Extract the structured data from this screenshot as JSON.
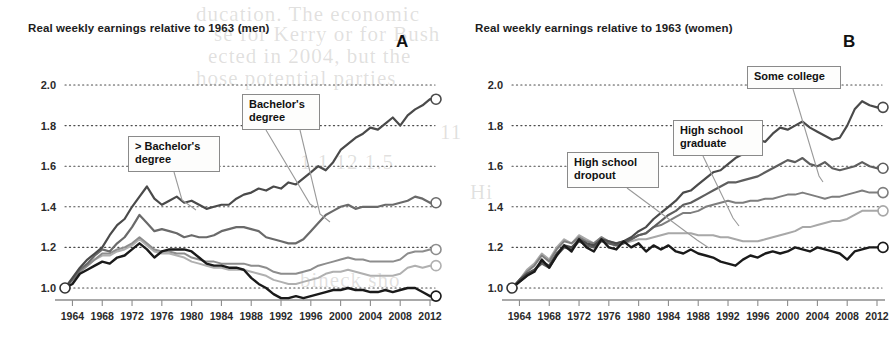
{
  "bleed_text": [
    {
      "text": "ducation. The economic",
      "x": 196,
      "y": 2
    },
    {
      "text": "se for Kerry or for Bush",
      "x": 214,
      "y": 22
    },
    {
      "text": "ected in 2004, but the",
      "x": 208,
      "y": 44
    },
    {
      "text": "hose potential parties",
      "x": 196,
      "y": 66
    },
    {
      "text": "11",
      "x": 440,
      "y": 120
    },
    {
      "text": "1.1  12  1.5",
      "x": 300,
      "y": 150
    },
    {
      "text": "Hi",
      "x": 470,
      "y": 180
    },
    {
      "text": "bineck  sho",
      "x": 300,
      "y": 268
    }
  ],
  "panels": [
    {
      "letter": "A",
      "letter_x": 396,
      "title": "Real weekly earnings relative to 1963 (men)",
      "callouts": [
        {
          "label": "> Bachelor's\ndegree",
          "x": 128,
          "y": 136,
          "w": 92,
          "h": 36,
          "leader": [
            [
              174,
              172
            ],
            [
              182,
              200
            ],
            [
              196,
              210
            ]
          ]
        },
        {
          "label": "Bachelor's\ndegree",
          "x": 242,
          "y": 94,
          "w": 78,
          "h": 36,
          "leader": [
            [
              300,
              130
            ],
            [
              320,
              214
            ],
            [
              330,
              222
            ]
          ]
        },
        {
          "label": "",
          "x": 0,
          "y": 0,
          "w": 0,
          "h": 0,
          "leader": [
            [
              266,
              130
            ],
            [
              310,
              204
            ],
            [
              316,
              208
            ]
          ]
        }
      ]
    },
    {
      "letter": "B",
      "letter_x": 396,
      "title": "Real weekly earnings relative to 1963 (women)",
      "callouts": [
        {
          "label": "High school\ndropout",
          "x": 120,
          "y": 152,
          "w": 92,
          "h": 36,
          "leader": [
            [
              180,
              188
            ],
            [
              250,
              240
            ],
            [
              262,
              248
            ]
          ]
        },
        {
          "label": "High school\ngraduate",
          "x": 226,
          "y": 120,
          "w": 90,
          "h": 36,
          "leader": [
            [
              256,
              156
            ],
            [
              286,
              218
            ],
            [
              292,
              226
            ]
          ]
        },
        {
          "label": "Some college",
          "x": 300,
          "y": 66,
          "w": 94,
          "h": 23,
          "leader": [
            [
              346,
              89
            ],
            [
              372,
              176
            ],
            [
              376,
              182
            ]
          ]
        }
      ]
    }
  ],
  "chart_data": [
    {
      "type": "line",
      "panel": "A",
      "title": "Real weekly earnings relative to 1963 (men)",
      "xlabel": "",
      "ylabel": "Real weekly earnings relative to 1963",
      "xlim": [
        1963,
        2012
      ],
      "ylim": [
        0.92,
        2.05
      ],
      "yticks": [
        1.0,
        1.2,
        1.4,
        1.6,
        1.8,
        2.0
      ],
      "ytick_labels": [
        "1.0",
        "1.2",
        "1.4",
        "1.6",
        "1.8",
        "2.0"
      ],
      "xticks": [
        1964,
        1968,
        1972,
        1976,
        1980,
        1984,
        1988,
        1992,
        1996,
        2000,
        2004,
        2008,
        2012
      ],
      "xtick_labels": [
        "1964",
        "1968",
        "1972",
        "1976",
        "1980",
        "1984",
        "1988",
        "1992",
        "1996",
        "2000",
        "2004",
        "2008",
        "2012"
      ],
      "grid": "horizontal-dotted",
      "legend": "annotated-callouts",
      "x": [
        1963,
        1964,
        1965,
        1966,
        1967,
        1968,
        1969,
        1970,
        1971,
        1972,
        1973,
        1974,
        1975,
        1976,
        1977,
        1978,
        1979,
        1980,
        1981,
        1982,
        1983,
        1984,
        1985,
        1986,
        1987,
        1988,
        1989,
        1990,
        1991,
        1992,
        1993,
        1994,
        1995,
        1996,
        1997,
        1998,
        1999,
        2000,
        2001,
        2002,
        2003,
        2004,
        2005,
        2006,
        2007,
        2008,
        2009,
        2010,
        2011,
        2012
      ],
      "series": [
        {
          "name": "> Bachelor's degree",
          "color": "#4a4a4a",
          "width": 2.2,
          "end_value": 1.93,
          "values": [
            1.0,
            1.05,
            1.1,
            1.14,
            1.17,
            1.2,
            1.26,
            1.31,
            1.34,
            1.4,
            1.45,
            1.5,
            1.44,
            1.41,
            1.43,
            1.45,
            1.42,
            1.43,
            1.41,
            1.39,
            1.4,
            1.41,
            1.41,
            1.44,
            1.46,
            1.47,
            1.49,
            1.48,
            1.5,
            1.49,
            1.52,
            1.51,
            1.54,
            1.57,
            1.6,
            1.58,
            1.62,
            1.68,
            1.71,
            1.74,
            1.76,
            1.79,
            1.78,
            1.81,
            1.84,
            1.8,
            1.85,
            1.88,
            1.9,
            1.93
          ]
        },
        {
          "name": "Bachelor's degree",
          "color": "#6a6a6a",
          "width": 2.2,
          "end_value": 1.42,
          "values": [
            1.0,
            1.04,
            1.09,
            1.12,
            1.16,
            1.19,
            1.18,
            1.22,
            1.25,
            1.3,
            1.36,
            1.32,
            1.28,
            1.29,
            1.28,
            1.27,
            1.25,
            1.26,
            1.25,
            1.25,
            1.26,
            1.28,
            1.29,
            1.3,
            1.3,
            1.29,
            1.28,
            1.25,
            1.24,
            1.23,
            1.22,
            1.22,
            1.24,
            1.28,
            1.32,
            1.36,
            1.38,
            1.4,
            1.41,
            1.39,
            1.4,
            1.4,
            1.4,
            1.41,
            1.41,
            1.42,
            1.43,
            1.45,
            1.44,
            1.42
          ]
        },
        {
          "name": "Some college",
          "color": "#8d8d8d",
          "width": 2.0,
          "end_value": 1.19,
          "values": [
            1.0,
            1.04,
            1.08,
            1.11,
            1.14,
            1.17,
            1.17,
            1.19,
            1.2,
            1.22,
            1.25,
            1.22,
            1.19,
            1.18,
            1.18,
            1.17,
            1.17,
            1.15,
            1.14,
            1.13,
            1.13,
            1.12,
            1.12,
            1.12,
            1.12,
            1.11,
            1.11,
            1.1,
            1.08,
            1.07,
            1.07,
            1.07,
            1.08,
            1.09,
            1.11,
            1.12,
            1.13,
            1.14,
            1.15,
            1.14,
            1.14,
            1.13,
            1.13,
            1.13,
            1.13,
            1.14,
            1.17,
            1.18,
            1.18,
            1.19
          ]
        },
        {
          "name": "High school graduate",
          "color": "#b0b0b0",
          "width": 2.0,
          "end_value": 1.11,
          "values": [
            1.0,
            1.04,
            1.08,
            1.11,
            1.14,
            1.16,
            1.16,
            1.18,
            1.19,
            1.21,
            1.24,
            1.21,
            1.18,
            1.17,
            1.17,
            1.16,
            1.15,
            1.13,
            1.12,
            1.11,
            1.1,
            1.1,
            1.09,
            1.09,
            1.09,
            1.08,
            1.07,
            1.06,
            1.04,
            1.03,
            1.02,
            1.02,
            1.03,
            1.04,
            1.05,
            1.07,
            1.08,
            1.08,
            1.09,
            1.08,
            1.07,
            1.06,
            1.06,
            1.06,
            1.06,
            1.07,
            1.1,
            1.11,
            1.1,
            1.11
          ]
        },
        {
          "name": "High school dropout",
          "color": "#1a1a1a",
          "width": 2.4,
          "end_value": 0.96,
          "values": [
            1.0,
            1.02,
            1.07,
            1.09,
            1.11,
            1.13,
            1.12,
            1.15,
            1.16,
            1.19,
            1.22,
            1.19,
            1.15,
            1.18,
            1.19,
            1.19,
            1.19,
            1.18,
            1.15,
            1.12,
            1.11,
            1.11,
            1.1,
            1.1,
            1.09,
            1.05,
            1.02,
            1.0,
            0.97,
            0.95,
            0.95,
            0.96,
            0.95,
            0.96,
            0.97,
            0.98,
            0.99,
            0.99,
            1.0,
            0.99,
            0.99,
            0.98,
            0.98,
            0.99,
            0.98,
            0.99,
            1.0,
            1.0,
            0.98,
            0.96
          ]
        }
      ]
    },
    {
      "type": "line",
      "panel": "B",
      "title": "Real weekly earnings relative to 1963 (women)",
      "xlabel": "",
      "ylabel": "Real weekly earnings relative to 1963",
      "xlim": [
        1963,
        2012
      ],
      "ylim": [
        0.92,
        2.05
      ],
      "yticks": [
        1.0,
        1.2,
        1.4,
        1.6,
        1.8,
        2.0
      ],
      "ytick_labels": [
        "1.0",
        "1.2",
        "1.4",
        "1.6",
        "1.8",
        "2.0"
      ],
      "xticks": [
        1964,
        1968,
        1972,
        1976,
        1980,
        1984,
        1988,
        1992,
        1996,
        2000,
        2004,
        2008,
        2012
      ],
      "xtick_labels": [
        "1964",
        "1968",
        "1972",
        "1976",
        "1980",
        "1984",
        "1988",
        "1992",
        "1996",
        "2000",
        "2004",
        "2008",
        "2012"
      ],
      "grid": "horizontal-dotted",
      "legend": "annotated-callouts",
      "x": [
        1963,
        1964,
        1965,
        1966,
        1967,
        1968,
        1969,
        1970,
        1971,
        1972,
        1973,
        1974,
        1975,
        1976,
        1977,
        1978,
        1979,
        1980,
        1981,
        1982,
        1983,
        1984,
        1985,
        1986,
        1987,
        1988,
        1989,
        1990,
        1991,
        1992,
        1993,
        1994,
        1995,
        1996,
        1997,
        1998,
        1999,
        2000,
        2001,
        2002,
        2003,
        2004,
        2005,
        2006,
        2007,
        2008,
        2009,
        2010,
        2011,
        2012
      ],
      "series": [
        {
          "name": "> Bachelor's degree",
          "color": "#4a4a4a",
          "width": 2.2,
          "end_value": 1.89,
          "values": [
            1.0,
            1.04,
            1.07,
            1.09,
            1.13,
            1.11,
            1.17,
            1.21,
            1.2,
            1.24,
            1.22,
            1.21,
            1.24,
            1.23,
            1.22,
            1.23,
            1.25,
            1.28,
            1.3,
            1.34,
            1.37,
            1.4,
            1.43,
            1.47,
            1.48,
            1.51,
            1.54,
            1.57,
            1.58,
            1.61,
            1.64,
            1.66,
            1.7,
            1.73,
            1.72,
            1.76,
            1.79,
            1.78,
            1.8,
            1.82,
            1.79,
            1.77,
            1.75,
            1.73,
            1.74,
            1.8,
            1.88,
            1.92,
            1.9,
            1.89
          ]
        },
        {
          "name": "Bachelor's degree",
          "color": "#5e5e5e",
          "width": 2.2,
          "end_value": 1.59,
          "values": [
            1.0,
            1.03,
            1.06,
            1.09,
            1.12,
            1.1,
            1.16,
            1.2,
            1.19,
            1.23,
            1.21,
            1.2,
            1.23,
            1.22,
            1.21,
            1.22,
            1.24,
            1.26,
            1.27,
            1.3,
            1.33,
            1.36,
            1.38,
            1.41,
            1.42,
            1.44,
            1.46,
            1.48,
            1.5,
            1.52,
            1.52,
            1.53,
            1.54,
            1.55,
            1.57,
            1.59,
            1.61,
            1.63,
            1.62,
            1.64,
            1.61,
            1.6,
            1.62,
            1.59,
            1.58,
            1.59,
            1.6,
            1.62,
            1.6,
            1.59
          ]
        },
        {
          "name": "Some college",
          "color": "#7e7e7e",
          "width": 2.0,
          "end_value": 1.47,
          "values": [
            1.0,
            1.04,
            1.08,
            1.11,
            1.16,
            1.13,
            1.19,
            1.23,
            1.22,
            1.25,
            1.23,
            1.22,
            1.25,
            1.23,
            1.22,
            1.23,
            1.24,
            1.26,
            1.27,
            1.3,
            1.31,
            1.33,
            1.35,
            1.37,
            1.37,
            1.38,
            1.4,
            1.41,
            1.42,
            1.43,
            1.42,
            1.42,
            1.43,
            1.43,
            1.44,
            1.44,
            1.45,
            1.46,
            1.46,
            1.47,
            1.46,
            1.45,
            1.44,
            1.45,
            1.45,
            1.46,
            1.47,
            1.48,
            1.47,
            1.47
          ]
        },
        {
          "name": "High school graduate",
          "color": "#a8a8a8",
          "width": 2.0,
          "end_value": 1.38,
          "values": [
            1.0,
            1.04,
            1.09,
            1.12,
            1.17,
            1.14,
            1.2,
            1.24,
            1.22,
            1.26,
            1.24,
            1.22,
            1.25,
            1.22,
            1.21,
            1.22,
            1.23,
            1.24,
            1.24,
            1.25,
            1.26,
            1.27,
            1.27,
            1.27,
            1.27,
            1.26,
            1.26,
            1.26,
            1.25,
            1.25,
            1.24,
            1.23,
            1.23,
            1.23,
            1.24,
            1.25,
            1.26,
            1.27,
            1.28,
            1.3,
            1.3,
            1.31,
            1.32,
            1.33,
            1.33,
            1.34,
            1.36,
            1.38,
            1.38,
            1.38
          ]
        },
        {
          "name": "High school dropout",
          "color": "#1a1a1a",
          "width": 2.4,
          "end_value": 1.2,
          "values": [
            1.0,
            1.03,
            1.06,
            1.08,
            1.14,
            1.1,
            1.16,
            1.21,
            1.18,
            1.24,
            1.2,
            1.18,
            1.24,
            1.2,
            1.19,
            1.23,
            1.2,
            1.22,
            1.18,
            1.21,
            1.19,
            1.21,
            1.18,
            1.17,
            1.19,
            1.17,
            1.16,
            1.15,
            1.13,
            1.12,
            1.11,
            1.14,
            1.16,
            1.15,
            1.17,
            1.18,
            1.17,
            1.18,
            1.2,
            1.19,
            1.18,
            1.2,
            1.19,
            1.18,
            1.17,
            1.14,
            1.18,
            1.19,
            1.2,
            1.2
          ]
        }
      ]
    }
  ]
}
